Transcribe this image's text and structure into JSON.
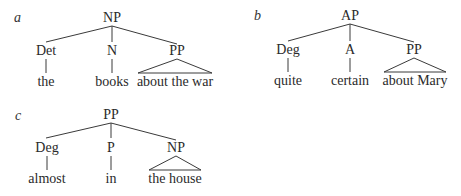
{
  "trees": [
    {
      "panel": "a",
      "root": "NP",
      "children": [
        {
          "label": "Det",
          "leaf": "the",
          "triangle": false
        },
        {
          "label": "N",
          "leaf": "books",
          "triangle": false
        },
        {
          "label": "PP",
          "leaf": "about the war",
          "triangle": true
        }
      ]
    },
    {
      "panel": "b",
      "root": "AP",
      "children": [
        {
          "label": "Deg",
          "leaf": "quite",
          "triangle": false
        },
        {
          "label": "A",
          "leaf": "certain",
          "triangle": false
        },
        {
          "label": "PP",
          "leaf": "about Mary",
          "triangle": true
        }
      ]
    },
    {
      "panel": "c",
      "root": "PP",
      "children": [
        {
          "label": "Deg",
          "leaf": "almost",
          "triangle": false
        },
        {
          "label": "P",
          "leaf": "in",
          "triangle": false
        },
        {
          "label": "NP",
          "leaf": "the house",
          "triangle": true
        }
      ]
    }
  ]
}
